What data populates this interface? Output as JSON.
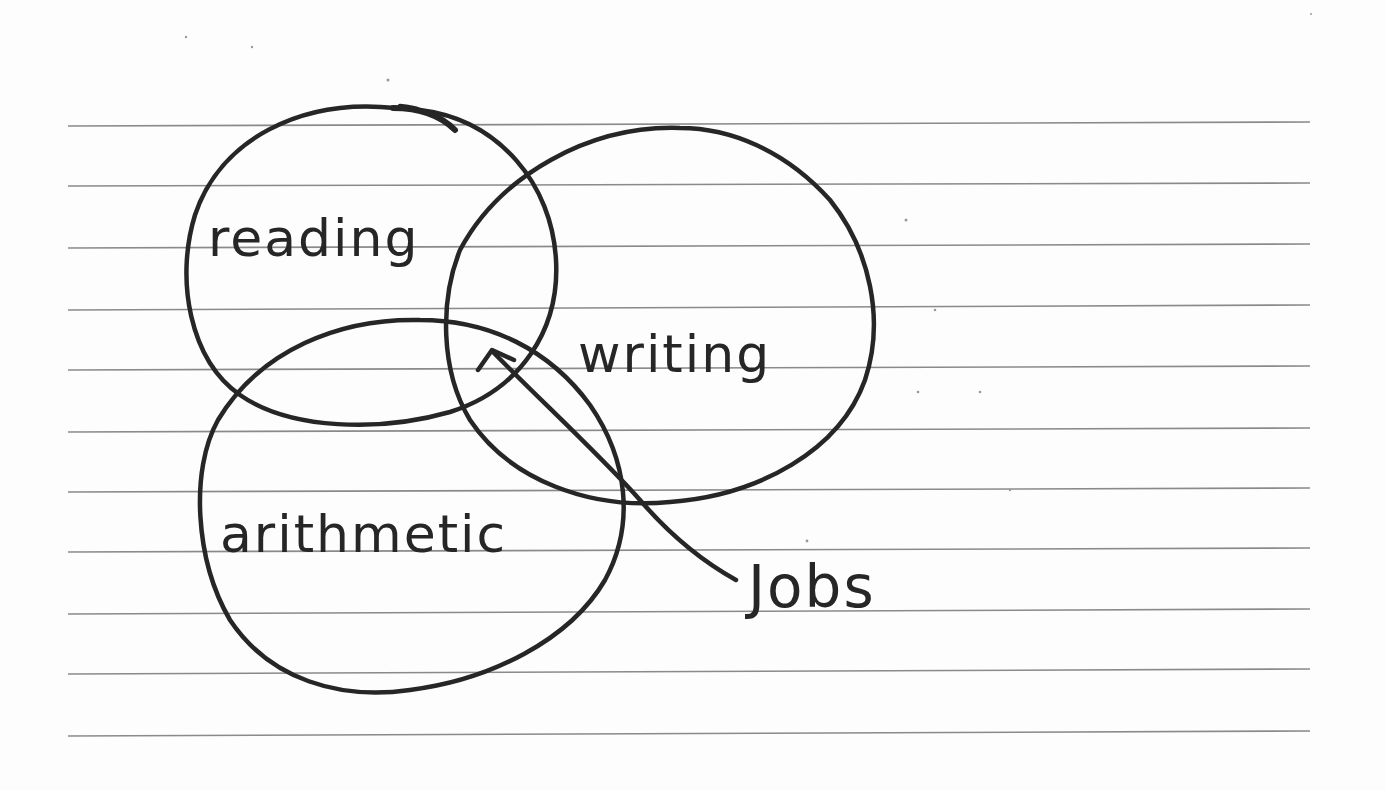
{
  "diagram": {
    "type": "venn",
    "style": "hand-drawn on lined paper",
    "sets": [
      {
        "label": "reading"
      },
      {
        "label": "writing"
      },
      {
        "label": "arithmetic"
      }
    ],
    "annotation": {
      "label": "Jobs",
      "points_to": "intersection of reading, writing, arithmetic"
    }
  },
  "labels": {
    "reading": "reading",
    "writing": "writing",
    "arithmetic": "arithmetic",
    "jobs": "Jobs"
  },
  "colors": {
    "ink": "#262626",
    "rule_lines": "#8a8a8a",
    "paper": "#fdfdfd"
  }
}
